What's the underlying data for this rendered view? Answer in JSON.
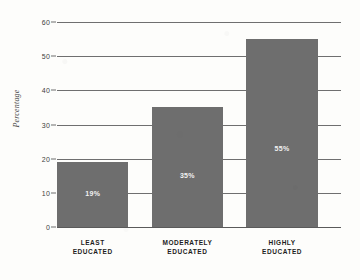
{
  "chart_data": {
    "type": "bar",
    "title": "",
    "subtitle": "",
    "xlabel": "",
    "ylabel": "Percentage",
    "categories": [
      "LEAST EDUCATED",
      "MODERATELY EDUCATED",
      "HIGHLY EDUCATED"
    ],
    "category_lines": [
      [
        "LEAST",
        "EDUCATED"
      ],
      [
        "MODERATELY",
        "EDUCATED"
      ],
      [
        "HIGHLY",
        "EDUCATED"
      ]
    ],
    "values": [
      19,
      35,
      55
    ],
    "data_labels": [
      "19%",
      "35%",
      "55%"
    ],
    "ylim": [
      0,
      60
    ],
    "ytick_values": [
      0,
      10,
      20,
      30,
      40,
      50,
      60
    ],
    "ytick_labels": [
      "0",
      "10",
      "20",
      "30",
      "40",
      "50",
      "60"
    ],
    "grid": true,
    "grid_orientation": "horizontal",
    "legend": false,
    "legend_position": "none",
    "bar_color": "#6e6e6e",
    "data_label_color": "#f2f2f2",
    "axis_color": "#6f6f6f",
    "background_color": "#fdfdfb"
  }
}
